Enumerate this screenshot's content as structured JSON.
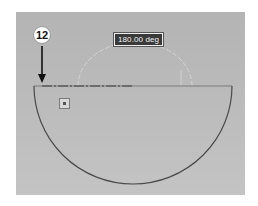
{
  "canvas": {
    "background_color": "#bababa"
  },
  "dimension": {
    "angle_label": "180.00 deg",
    "label_bg_color": "#3a3a3a",
    "label_text_color": "#f2f2f2"
  },
  "callout": {
    "step_number": "12",
    "arrow_target": "left end of centerline"
  },
  "sketch": {
    "semicircle_color": "#4a4a4a",
    "preview_arc_color": "#d0d0d0",
    "centerline_color": "#4a4a4a"
  },
  "icons": {
    "dimension_handle": "dimension-handle-icon",
    "arrow": "down-arrow-icon"
  }
}
